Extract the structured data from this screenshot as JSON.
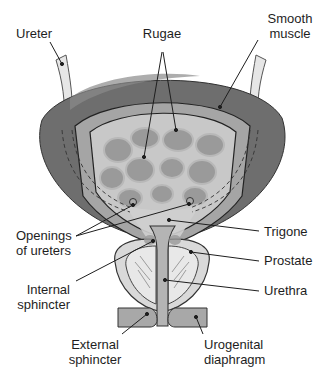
{
  "diagram": {
    "colors": {
      "outer_wall": "#6e6e6e",
      "muscle_layer": "#a5a5a5",
      "mucosa": "#c8c8c8",
      "rugae": "#9a9a9a",
      "prostate": "#d9d9d9",
      "urethra": "#b4b4b4",
      "ureter": "#e6e6e6",
      "line": "#1e1e1e"
    },
    "labels": {
      "ureter": "Ureter",
      "rugae": "Rugae",
      "smooth_muscle": "Smooth\nmuscle",
      "openings_of_ureters": "Openings\nof ureters",
      "trigone": "Trigone",
      "prostate": "Prostate",
      "internal_sphincter": "Internal\nsphincter",
      "urethra": "Urethra",
      "external_sphincter": "External\nsphincter",
      "urogenital_diaphragm": "Urogenital\ndiaphragm"
    }
  }
}
